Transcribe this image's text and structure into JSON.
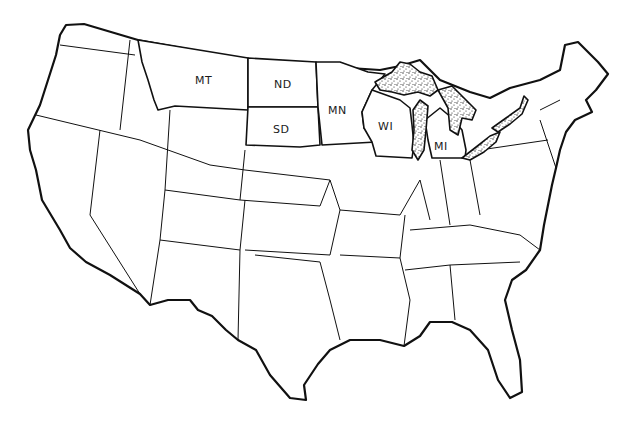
{
  "map": {
    "title": "United States map with highlighted northern states",
    "background_color": "#ffffff",
    "ink_color": "#111111",
    "fill_patterns": {
      "other_states": "diagonal-hatch",
      "highlighted_states": "white",
      "great_lakes": "stipple"
    },
    "highlighted_states": [
      {
        "abbr": "MT",
        "x": 205,
        "y": 82
      },
      {
        "abbr": "ND",
        "x": 283,
        "y": 86
      },
      {
        "abbr": "SD",
        "x": 282,
        "y": 131
      },
      {
        "abbr": "MN",
        "x": 338,
        "y": 112
      },
      {
        "abbr": "WI",
        "x": 385,
        "y": 128
      },
      {
        "abbr": "MI",
        "x": 440,
        "y": 148
      }
    ]
  }
}
